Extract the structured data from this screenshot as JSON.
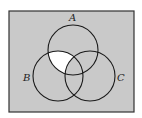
{
  "diagram": {
    "type": "venn",
    "universe": {
      "x": 9,
      "y": 11,
      "width": 125,
      "height": 101,
      "fill": "#c9c9c9",
      "stroke": "#333333"
    },
    "circles": [
      {
        "label": "A",
        "cx": 73,
        "cy": 50,
        "r": 25,
        "label_x": 72,
        "label_y": 21
      },
      {
        "label": "B",
        "cx": 58,
        "cy": 76,
        "r": 25,
        "label_x": 24,
        "label_y": 81
      },
      {
        "label": "C",
        "cx": 90,
        "cy": 76,
        "r": 25,
        "label_x": 116,
        "label_y": 81
      }
    ],
    "shaded_region": "A ∩ B − C",
    "highlight_fill": "#ffffff",
    "circle_stroke": "#1a1a1a"
  }
}
